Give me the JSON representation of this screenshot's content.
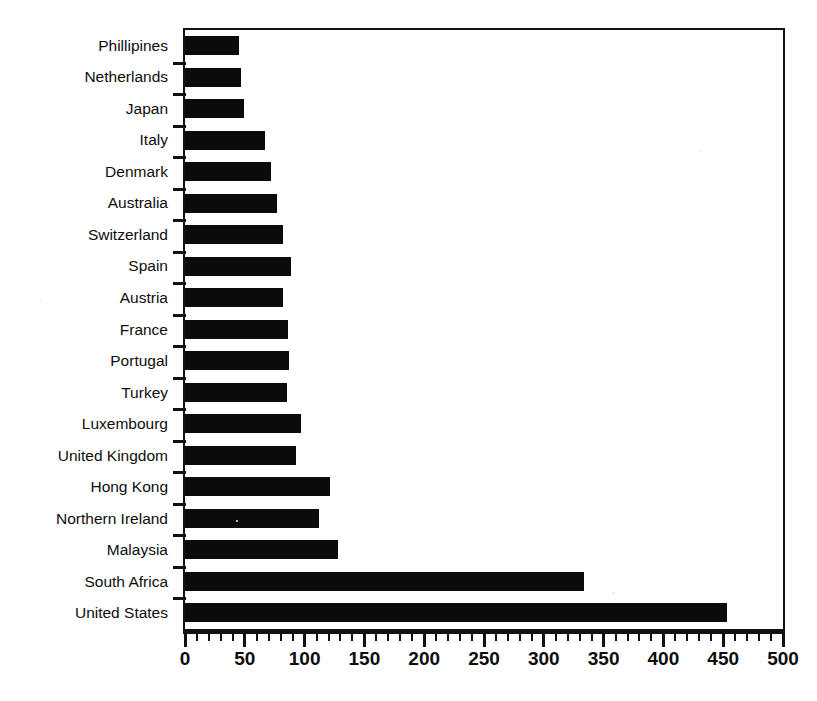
{
  "figure": {
    "top_partial_text": "",
    "background_color": "#ffffff",
    "bar_color": "#0b0b0b",
    "axis_color": "#111111"
  },
  "chart_data": {
    "type": "bar",
    "orientation": "horizontal",
    "title": "",
    "subtitle": "",
    "xlabel": "",
    "ylabel": "",
    "xlim": [
      0,
      500
    ],
    "grid": false,
    "legend": null,
    "xticks": [
      0,
      50,
      100,
      150,
      200,
      250,
      300,
      350,
      400,
      450,
      500
    ],
    "xtick_labels": [
      "0",
      "50",
      "100",
      "150",
      "200",
      "250",
      "300",
      "350",
      "400",
      "450",
      "500"
    ],
    "minor_tick_interval": 10,
    "categories": [
      "Phillipines",
      "Netherlands",
      "Japan",
      "Italy",
      "Denmark",
      "Australia",
      "Switzerland",
      "Spain",
      "Austria",
      "France",
      "Portugal",
      "Turkey",
      "Luxembourg",
      "United Kingdom",
      "Hong Kong",
      "Northern Ireland",
      "Malaysia",
      "South Africa",
      "United States"
    ],
    "values": [
      45,
      47,
      49,
      67,
      72,
      77,
      82,
      89,
      82,
      86,
      87,
      85,
      97,
      93,
      121,
      112,
      128,
      334,
      453
    ]
  }
}
